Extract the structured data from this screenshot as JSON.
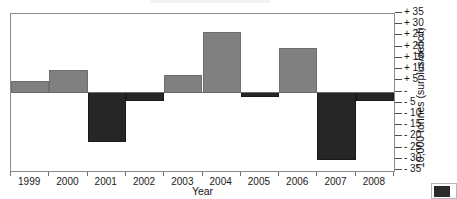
{
  "chart_data": {
    "type": "bar",
    "title": "",
    "subtitle": "",
    "xlabel": "Year",
    "ylabel": "10,000 tonnes (surplus/deficit)",
    "categories": [
      "1999",
      "2000",
      "2001",
      "2002",
      "2003",
      "2004",
      "2005",
      "2006",
      "2007",
      "2008"
    ],
    "values": [
      5,
      10,
      -22,
      -4,
      8,
      27,
      -2,
      20,
      -30,
      -4
    ],
    "ylim": [
      -35,
      35
    ],
    "ytick_values": [
      35,
      30,
      25,
      20,
      15,
      10,
      5,
      0,
      -5,
      -10,
      -15,
      -20,
      -25,
      -30,
      -35
    ],
    "ytick_labels": [
      "+ 35",
      "+ 30",
      "+ 25",
      "+ 20",
      "+ 15",
      "+ 10",
      "+ 5",
      "-",
      "- 5",
      "- 10",
      "- 15",
      "- 20",
      "- 25",
      "- 30",
      "- 35"
    ],
    "grid": false,
    "legend_position": "bottom-right",
    "series": [
      {
        "name": "surplus",
        "color": "#808080"
      },
      {
        "name": "deficit",
        "color": "#262626"
      }
    ],
    "annotations": []
  },
  "axes": {
    "y_title": "10,000 tonnes (surplus/deficit)",
    "x_title": "Year"
  },
  "legend": {
    "swatch_color": "#2b2b2b",
    "label": ""
  },
  "colors": {
    "positive_bar": "#808080",
    "negative_bar": "#262626",
    "frame": "#8c8c8c",
    "zero_line": "#6b6b6b",
    "text": "#1a1a1a"
  }
}
